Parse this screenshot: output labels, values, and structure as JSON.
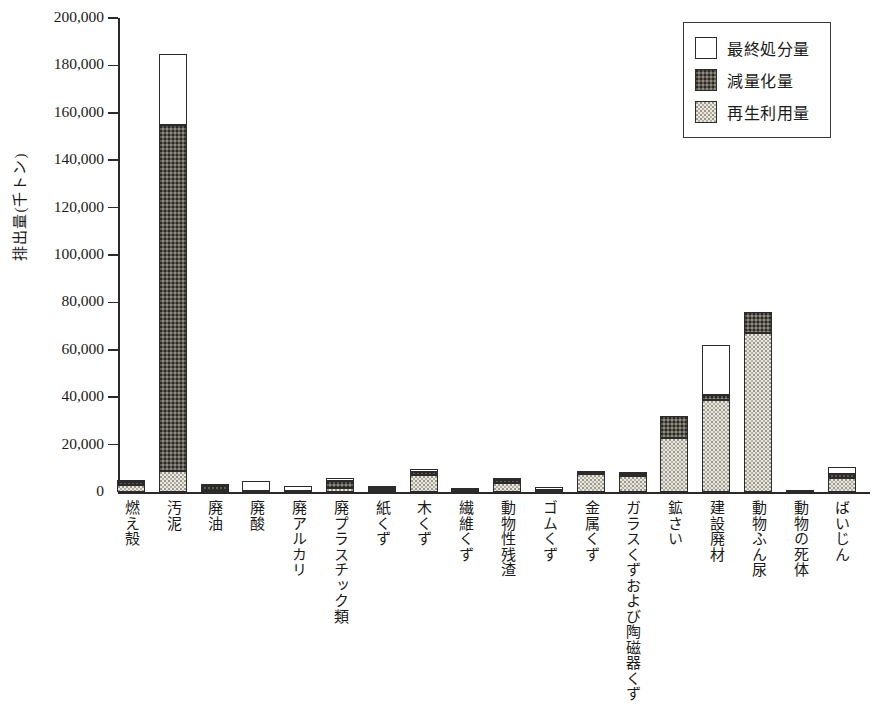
{
  "chart_data": {
    "type": "bar",
    "subtype": "stacked-bar",
    "title": "",
    "xlabel": "",
    "ylabel": "排出量(千トン)",
    "ylim": [
      0,
      200000
    ],
    "ytick_step": 20000,
    "ytick_labels": [
      "200,000",
      "180,000",
      "160,000",
      "140,000",
      "120,000",
      "100,000",
      "80,000",
      "60,000",
      "40,000",
      "20,000",
      "0"
    ],
    "ytick_values": [
      200000,
      180000,
      160000,
      140000,
      120000,
      100000,
      80000,
      60000,
      40000,
      20000,
      0
    ],
    "grid": false,
    "legend_position": "top-right",
    "categories": [
      "燃え殻",
      "汚泥",
      "廃油",
      "廃酸",
      "廃アルカリ",
      "廃プラスチック類",
      "紙くず",
      "木くず",
      "繊維くず",
      "動物性残渣",
      "ゴムくず",
      "金属くず",
      "ガラスくずおよび陶磁器くず",
      "鉱さい",
      "建設廃材",
      "動物ふん尿",
      "動物の死体",
      "ばいじん"
    ],
    "series": [
      {
        "name": "再生利用量",
        "key": "recycle",
        "color": "#e9e7de",
        "values": [
          2800,
          9000,
          900,
          300,
          200,
          1900,
          900,
          7000,
          300,
          3600,
          600,
          7800,
          6800,
          23000,
          39000,
          67000,
          100,
          6000
        ]
      },
      {
        "name": "減量化量",
        "key": "reduce",
        "color": "#5d5a52",
        "values": [
          1300,
          146000,
          1700,
          300,
          300,
          2800,
          700,
          1600,
          600,
          1500,
          400,
          300,
          700,
          9000,
          2000,
          9000,
          400,
          1500
        ]
      },
      {
        "name": "最終処分量",
        "key": "final",
        "color": "#ffffff",
        "values": [
          900,
          30000,
          400,
          3900,
          2000,
          1300,
          400,
          900,
          300,
          400,
          500,
          400,
          1000,
          0,
          21000,
          0,
          0,
          3000
        ]
      }
    ],
    "totals": [
      5000,
      185000,
      3000,
      4500,
      2500,
      6000,
      2000,
      9500,
      1200,
      5500,
      1500,
      8500,
      8500,
      32000,
      62000,
      76000,
      500,
      10500
    ]
  },
  "legend": {
    "items": [
      {
        "label": "最終処分量",
        "key": "final"
      },
      {
        "label": "減量化量",
        "key": "reduce"
      },
      {
        "label": "再生利用量",
        "key": "recycle"
      }
    ]
  }
}
